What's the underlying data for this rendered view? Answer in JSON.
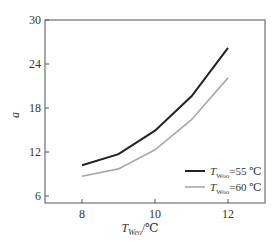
{
  "chart_data": {
    "type": "line",
    "title": "",
    "xlabel": "T_Weo/℃",
    "xlabel_main": "T",
    "xlabel_sub": "Weo",
    "xlabel_unit": "/℃",
    "ylabel": "a",
    "x": [
      8,
      9,
      10,
      11,
      12
    ],
    "xticks": [
      8,
      10,
      12
    ],
    "xtick_labels": [
      "8",
      "10",
      "12"
    ],
    "yticks": [
      6,
      12,
      18,
      24,
      30
    ],
    "ytick_labels": [
      "6",
      "12",
      "18",
      "24",
      "30"
    ],
    "xlim": [
      7.0,
      13.0
    ],
    "ylim": [
      5.0,
      30
    ],
    "grid": false,
    "legend_position": "lower right",
    "series": [
      {
        "name": "T_Woo=55 ℃",
        "legend_main": "T",
        "legend_sub": "Woo",
        "legend_value": "=55 ℃",
        "color": "#222222",
        "values": [
          10.2,
          11.7,
          14.9,
          19.6,
          26.2
        ]
      },
      {
        "name": "T_Woo=60 ℃",
        "legend_main": "T",
        "legend_sub": "Woo",
        "legend_value": "=60 ℃",
        "color": "#a8a8a8",
        "values": [
          8.7,
          9.7,
          12.3,
          16.4,
          22.1
        ]
      }
    ]
  }
}
